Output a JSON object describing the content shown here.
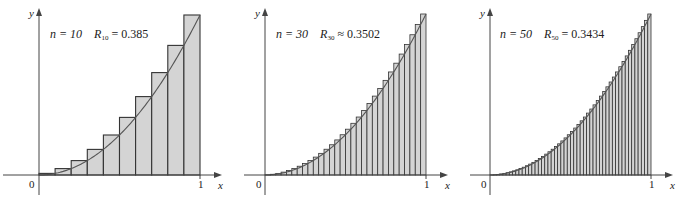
{
  "chart_data": [
    {
      "type": "bar",
      "title": "n = 10  R10 = 0.385",
      "function": "y = x^2",
      "n": 10,
      "label_n": "n = 10",
      "label_R_sym": "R",
      "label_R_sub": "10",
      "label_R_rel": "=",
      "label_R_val": "0.385",
      "xlabel": "x",
      "ylabel": "y",
      "x_ticks": [
        "0",
        "1"
      ],
      "xlim": [
        0,
        1
      ],
      "ylim": [
        0,
        1
      ],
      "categories": [
        "0.1",
        "0.2",
        "0.3",
        "0.4",
        "0.5",
        "0.6",
        "0.7",
        "0.8",
        "0.9",
        "1.0"
      ],
      "values": [
        0.01,
        0.04,
        0.09,
        0.16,
        0.25,
        0.36,
        0.49,
        0.64,
        0.81,
        1.0
      ],
      "curve": true,
      "grid": false
    },
    {
      "type": "bar",
      "title": "n = 30  R30 ≈ 0.3502",
      "function": "y = x^2",
      "n": 30,
      "label_n": "n = 30",
      "label_R_sym": "R",
      "label_R_sub": "30",
      "label_R_rel": "≈",
      "label_R_val": "0.3502",
      "xlabel": "x",
      "ylabel": "y",
      "x_ticks": [
        "0",
        "1"
      ],
      "xlim": [
        0,
        1
      ],
      "ylim": [
        0,
        1
      ],
      "curve": true,
      "grid": false
    },
    {
      "type": "bar",
      "title": "n = 50  R50 = 0.3434",
      "function": "y = x^2",
      "n": 50,
      "label_n": "n = 50",
      "label_R_sym": "R",
      "label_R_sub": "50",
      "label_R_rel": "=",
      "label_R_val": "0.3434",
      "xlabel": "x",
      "ylabel": "y",
      "x_ticks": [
        "0",
        "1"
      ],
      "xlim": [
        0,
        1
      ],
      "ylim": [
        0,
        1
      ],
      "curve": true,
      "grid": false
    }
  ],
  "style": {
    "bar_fill": "#d4d4d4",
    "bar_stroke": "#333333",
    "curve_stroke": "#555555",
    "axis_stroke": "#444444"
  },
  "layout": [
    {
      "x0": 39,
      "x1": 200,
      "y0": 175,
      "ytop": 15,
      "yaxis_top": 8,
      "xaxis_left": 3,
      "xaxis_right": 222,
      "yaxis_bottom": 195
    },
    {
      "x0": 265,
      "x1": 426,
      "y0": 175,
      "ytop": 14,
      "yaxis_top": 8,
      "xaxis_left": 244,
      "xaxis_right": 448,
      "yaxis_bottom": 195
    },
    {
      "x0": 490,
      "x1": 651,
      "y0": 175,
      "ytop": 14,
      "yaxis_top": 8,
      "xaxis_left": 470,
      "xaxis_right": 673,
      "yaxis_bottom": 195
    }
  ]
}
